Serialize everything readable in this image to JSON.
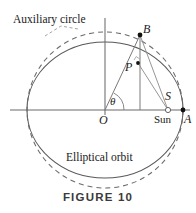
{
  "figure": {
    "caption": "FIGURE 10",
    "background_color": "#ffffff",
    "stroke_color": "#555555",
    "accent_color": "#1a1a1a"
  },
  "labels": {
    "auxiliary_circle": "Auxiliary circle",
    "elliptical_orbit": "Elliptical orbit",
    "point_b": "B",
    "point_p": "P",
    "point_o": "O",
    "point_s": "S",
    "point_a": "A",
    "sun": "Sun",
    "angle_theta": "θ"
  },
  "geometry": {
    "center": {
      "x": 105,
      "y": 110
    },
    "ellipse": {
      "rx": 78,
      "ry": 68
    },
    "auxiliary_circle": {
      "r": 78,
      "dashed": true
    },
    "points": {
      "B": {
        "x": 140,
        "y": 35,
        "marker": "filled-dot",
        "on": "auxiliary-circle"
      },
      "P": {
        "x": 138,
        "y": 63,
        "marker": "filled-dot",
        "on": "ellipse"
      },
      "O": {
        "x": 105,
        "y": 110,
        "marker": "none",
        "role": "center"
      },
      "S": {
        "x": 168,
        "y": 110,
        "marker": "open-circle",
        "role": "sun-focus"
      },
      "A": {
        "x": 183,
        "y": 110,
        "marker": "filled-dot",
        "role": "perihelion-vertex"
      },
      "foot": {
        "x": 140,
        "y": 110,
        "marker": "none",
        "role": "foot-of-perpendicular"
      }
    },
    "axes": {
      "horizontal": {
        "y": 110,
        "x1": 10,
        "x2": 190
      },
      "vertical": {
        "x": 105,
        "y1": 18,
        "y2": 115
      }
    },
    "segments": [
      {
        "name": "OB",
        "from": "O",
        "to": "B"
      },
      {
        "name": "B-foot",
        "from": "B",
        "to": "foot"
      },
      {
        "name": "BS",
        "from": "B",
        "to": "S"
      },
      {
        "name": "PS",
        "from": "P",
        "to": "S"
      }
    ],
    "angle_arc": {
      "at": "O",
      "between": [
        "x-axis",
        "OB"
      ],
      "label": "θ"
    }
  }
}
